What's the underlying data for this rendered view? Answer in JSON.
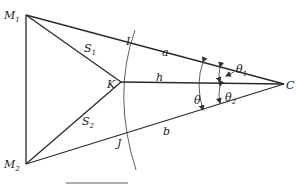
{
  "diagram": {
    "type": "geometry",
    "points": {
      "M1": {
        "label": "M",
        "sub": "1",
        "x": 26,
        "y": 15
      },
      "M2": {
        "label": "M",
        "sub": "2",
        "x": 26,
        "y": 164
      },
      "K": {
        "label": "K",
        "x": 121,
        "y": 82
      },
      "C": {
        "label": "C",
        "x": 284,
        "y": 84
      },
      "I": {
        "label": "I",
        "x": 128,
        "y": 49
      },
      "J": {
        "label": "J",
        "x": 125,
        "y": 146
      }
    },
    "segments": [
      {
        "from": "M1",
        "to": "M2"
      },
      {
        "from": "M1",
        "to": "K",
        "label": "S",
        "sub": "1"
      },
      {
        "from": "M2",
        "to": "K",
        "label": "S",
        "sub": "2"
      },
      {
        "from": "M1",
        "to": "C",
        "label": "a"
      },
      {
        "from": "M2",
        "to": "C",
        "label": "b"
      },
      {
        "from": "K",
        "to": "C",
        "label": "h"
      }
    ],
    "angles": [
      {
        "label": "θ",
        "between": [
          "a",
          "b"
        ]
      },
      {
        "label": "θ",
        "sub": "1",
        "between": [
          "a",
          "h"
        ]
      },
      {
        "label": "θ",
        "sub": "2",
        "between": [
          "h",
          "b"
        ]
      }
    ],
    "labels": {
      "M1": "M",
      "M1_sub": "1",
      "M2": "M",
      "M2_sub": "2",
      "S1": "S",
      "S1_sub": "1",
      "S2": "S",
      "S2_sub": "2",
      "K": "K",
      "C": "C",
      "I": "I",
      "J": "J",
      "a": "a",
      "b": "b",
      "h": "h",
      "theta": "θ",
      "theta1": "θ",
      "theta1_sub": "1",
      "theta2": "θ",
      "theta2_sub": "2"
    }
  }
}
